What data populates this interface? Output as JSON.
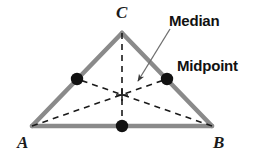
{
  "figure": {
    "background_color": "#ffffff"
  },
  "colors": {
    "triangle_edge": "#8a8a8a",
    "median_dash": "#1a1a1a",
    "midpoint_dot": "#111111",
    "label_text": "#111111",
    "vertex_text": "#1a1a1a",
    "leader_line": "#6f6f6f"
  },
  "vertices": [
    {
      "name": "C",
      "label": "C",
      "x": 122,
      "y": 33
    },
    {
      "name": "A",
      "label": "A",
      "x": 32,
      "y": 126
    },
    {
      "name": "B",
      "label": "B",
      "x": 212,
      "y": 126
    }
  ],
  "midpoints": [
    {
      "name": "midpoint-AC",
      "label": "Midpoint",
      "x": 77,
      "y": 79
    },
    {
      "name": "midpoint-BC",
      "label": "Midpoint",
      "x": 167,
      "y": 79
    },
    {
      "name": "midpoint-AB",
      "label": "Midpoint",
      "x": 122,
      "y": 126
    }
  ],
  "centroid": {
    "name": "centroid",
    "x": 122,
    "y": 95
  },
  "medians": [
    {
      "name": "median-C-to-AB",
      "from": "C",
      "to": "midpoint-AB"
    },
    {
      "name": "median-A-to-BC",
      "from": "A",
      "to": "midpoint-BC"
    },
    {
      "name": "median-B-to-AC",
      "from": "B",
      "to": "midpoint-AC"
    }
  ],
  "callouts": [
    {
      "name": "median",
      "label": "Median",
      "text_x": 169,
      "text_y": 13,
      "leader_start_x": 170,
      "leader_start_y": 29,
      "leader_end_x": 137,
      "leader_end_y": 82
    },
    {
      "name": "midpoint",
      "label": "Midpoint",
      "text_x": 177,
      "text_y": 58
    }
  ],
  "vertex_labels": {
    "C": "C",
    "A": "A",
    "B": "B"
  },
  "callout_labels": {
    "median": "Median",
    "midpoint": "Midpoint"
  }
}
